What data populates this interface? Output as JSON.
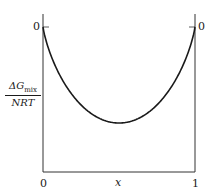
{
  "chart_data": {
    "type": "line",
    "title": "",
    "xlabel": "x",
    "ylabel": "ΔG_mix / NRT",
    "ylabel_parts": {
      "delta": "ΔG",
      "sub": "mix",
      "denominator": "NRT"
    },
    "x_ticks": [
      "0",
      "1"
    ],
    "y_ticks_left": [
      "0"
    ],
    "y_ticks_right": [
      "0"
    ],
    "xlim": [
      0,
      1
    ],
    "grid": false,
    "legend": null,
    "series": [
      {
        "name": "ΔG_mix/NRT",
        "description": "x ln x + (1-x) ln(1-x), symmetric well with minimum at x=0.5",
        "x": [
          0,
          0.01,
          0.05,
          0.1,
          0.2,
          0.3,
          0.4,
          0.5,
          0.6,
          0.7,
          0.8,
          0.9,
          0.95,
          0.99,
          1
        ],
        "values": [
          0,
          -0.056,
          -0.199,
          -0.325,
          -0.5,
          -0.611,
          -0.673,
          -0.693,
          -0.673,
          -0.611,
          -0.5,
          -0.325,
          -0.199,
          -0.056,
          0
        ]
      }
    ],
    "color": "#1a1a1a"
  }
}
